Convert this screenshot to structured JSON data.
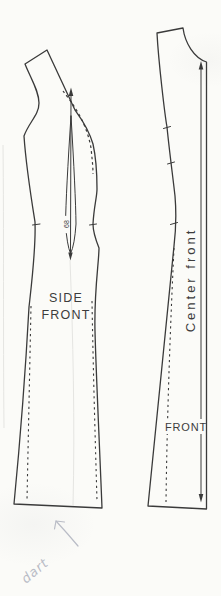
{
  "diagram": {
    "kind": "sewing pattern sheet with two dress pattern pieces",
    "pieces": [
      {
        "id": "side-front",
        "label_line1": "SIDE",
        "label_line2": "FRONT",
        "dart_number": "68"
      },
      {
        "id": "front",
        "label": "FRONT",
        "fold_edge_label": "Center front"
      }
    ],
    "handwritten_annotation": "dart"
  },
  "colors": {
    "paper": "#fbfbf8",
    "ink": "#3a3a3a",
    "text": "#3c3c3c",
    "pencil": "#b9bcc6",
    "faint": "#e5e5e2"
  }
}
